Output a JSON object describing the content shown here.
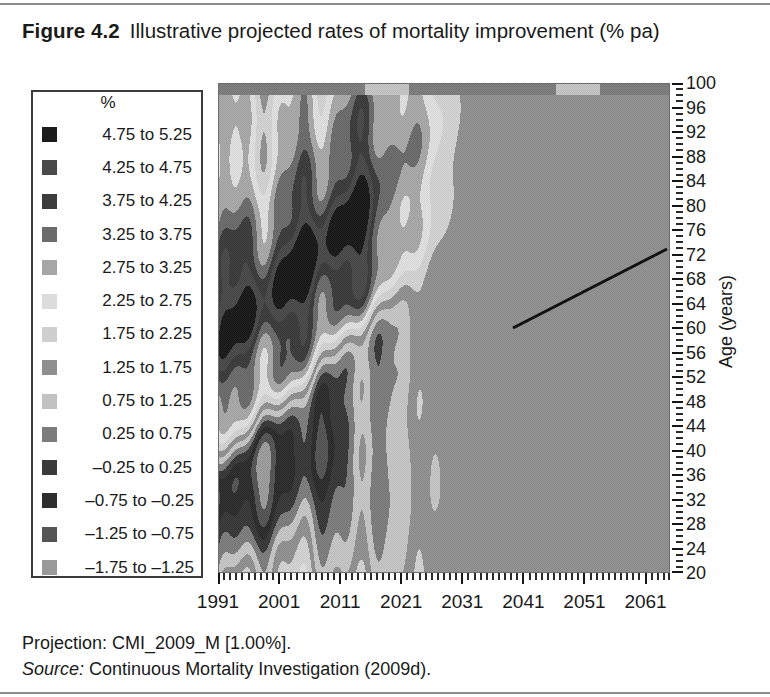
{
  "figure": {
    "number": "Figure 4.2",
    "title": "Illustrative projected rates of mortality improvement (% pa)"
  },
  "legend": {
    "title": "%",
    "items": [
      {
        "label": "4.75 to 5.25",
        "color": "#1c1c1c"
      },
      {
        "label": "4.25 to 4.75",
        "color": "#4a4a4a"
      },
      {
        "label": "3.75 to 4.25",
        "color": "#3d3d3d"
      },
      {
        "label": "3.25 to 3.75",
        "color": "#6b6b6b"
      },
      {
        "label": "2.75 to 3.25",
        "color": "#a6a6a6"
      },
      {
        "label": "2.25 to 2.75",
        "color": "#dcdcdc"
      },
      {
        "label": "1.75 to 2.25",
        "color": "#cfcfcf"
      },
      {
        "label": "1.25 to 1.75",
        "color": "#8f8f8f"
      },
      {
        "label": "0.75 to 1.25",
        "color": "#c2c2c2"
      },
      {
        "label": "0.25 to 0.75",
        "color": "#7c7c7c"
      },
      {
        "label": "–0.25 to 0.25",
        "color": "#3a3a3a"
      },
      {
        "label": "–0.75 to –0.25",
        "color": "#2e2e2e"
      },
      {
        "label": "–1.25 to –0.75",
        "color": "#555555"
      },
      {
        "label": "–1.75 to –1.25",
        "color": "#9a9a9a"
      }
    ]
  },
  "annotations": [
    {
      "name": "cohort-effect",
      "text": "Cohort effect"
    }
  ],
  "footer": {
    "projection": "Projection: CMI_2009_M [1.00%].",
    "source_label": "Source:",
    "source_text": "Continuous Mortality Investigation (2009d)."
  },
  "chart_data": {
    "type": "heatmap",
    "title": "Illustrative projected rates of mortality improvement (% pa)",
    "xlabel": "",
    "ylabel": "Age (years)",
    "xlim": [
      1991,
      2065
    ],
    "ylim": [
      20,
      100
    ],
    "xticks": [
      1991,
      2001,
      2011,
      2021,
      2031,
      2041,
      2051,
      2061
    ],
    "yticks": [
      20,
      24,
      28,
      32,
      36,
      40,
      44,
      48,
      52,
      56,
      60,
      64,
      68,
      72,
      76,
      80,
      84,
      88,
      92,
      96,
      100
    ],
    "x_minor_step": 1,
    "y_minor_step": 1,
    "grid": false,
    "legend_position": "left-outside",
    "colorbar_levels": [
      -1.75,
      -1.25,
      -0.75,
      -0.25,
      0.25,
      0.75,
      1.25,
      1.75,
      2.25,
      2.75,
      3.25,
      3.75,
      4.25,
      4.75,
      5.25
    ],
    "value_unit": "% pa",
    "features": [
      {
        "name": "cohort-ridge",
        "type": "diagonal-band",
        "note": "High improvement band running up-right, ~age 68 in 2002 to ~age 88 in 2015"
      },
      {
        "name": "low-improvement-pocket",
        "type": "dark-blob",
        "note": "Negative/low rates around ages 30-45 in the 1990s"
      },
      {
        "name": "long-term-plateau",
        "type": "uniform-region",
        "value": 1.5,
        "note": "Uniform shading right of ~2035 across all ages"
      }
    ],
    "series_grid_note": "Values rendered as banded grayscale contours matching the 14 legend classes."
  }
}
